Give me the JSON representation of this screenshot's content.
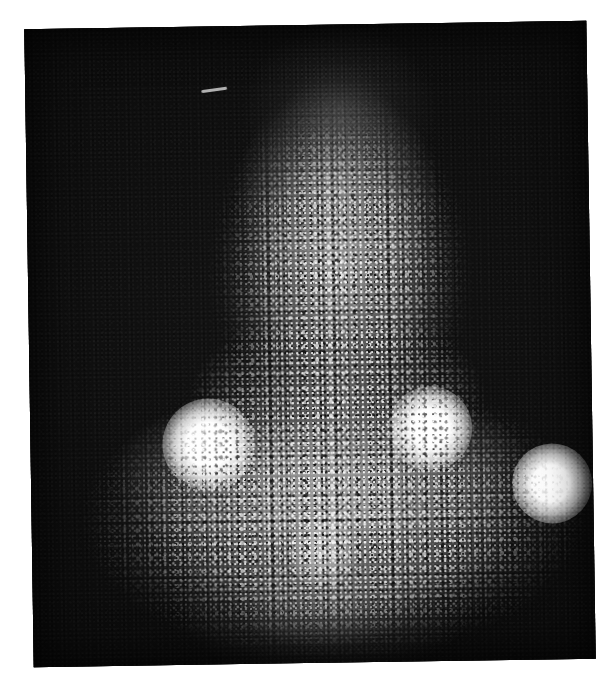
{
  "image": {
    "kind": "scintigram",
    "title": "Radionuclide scintigraphic scan",
    "modality": "Nuclear medicine dot-matrix scintigraphy photograph",
    "orientation": "anterior",
    "background_color": "#ffffff",
    "plate_color": "#0a0a0a",
    "activity_color": "#ffffff",
    "caption": "",
    "plate": {
      "left": 29,
      "top": 25,
      "width": 562,
      "height": 638,
      "rotation_deg": -0.85
    },
    "regions": [
      {
        "name": "upper-column",
        "label": "Upper vertical uptake column",
        "center_x": 320,
        "center_y": 255,
        "radius_x": 130,
        "radius_y": 175,
        "intensity": 0.55
      },
      {
        "name": "lower-band",
        "label": "Broad lower horizontal uptake band",
        "center_x": 310,
        "center_y": 500,
        "radius_x": 250,
        "radius_y": 135,
        "intensity": 0.5
      },
      {
        "name": "bridge",
        "label": "Mid bridging activity",
        "center_x": 315,
        "center_y": 385,
        "radius_x": 150,
        "radius_y": 90,
        "intensity": 0.3
      }
    ],
    "hotspots": [
      {
        "name": "hotspot-left",
        "label": "Left focal hot spot",
        "center_x": 178,
        "center_y": 418,
        "radius": 46,
        "intensity": 1.0
      },
      {
        "name": "hotspot-center-right",
        "label": "Centre-right focal hot spot",
        "center_x": 400,
        "center_y": 405,
        "radius": 42,
        "intensity": 1.0
      },
      {
        "name": "hotspot-far-right",
        "label": "Far-right focal hot spot",
        "center_x": 521,
        "center_y": 462,
        "radius": 40,
        "intensity": 0.95
      },
      {
        "name": "hotspot-lower-center",
        "label": "Faint lower-centre focal spot",
        "center_x": 290,
        "center_y": 528,
        "radius": 34,
        "intensity": 0.45
      }
    ],
    "artifacts": [
      {
        "name": "streak-artifact",
        "label": "Linear bright streak artifact",
        "x": 176,
        "y": 62,
        "length": 26,
        "angle_deg": -7
      }
    ]
  }
}
